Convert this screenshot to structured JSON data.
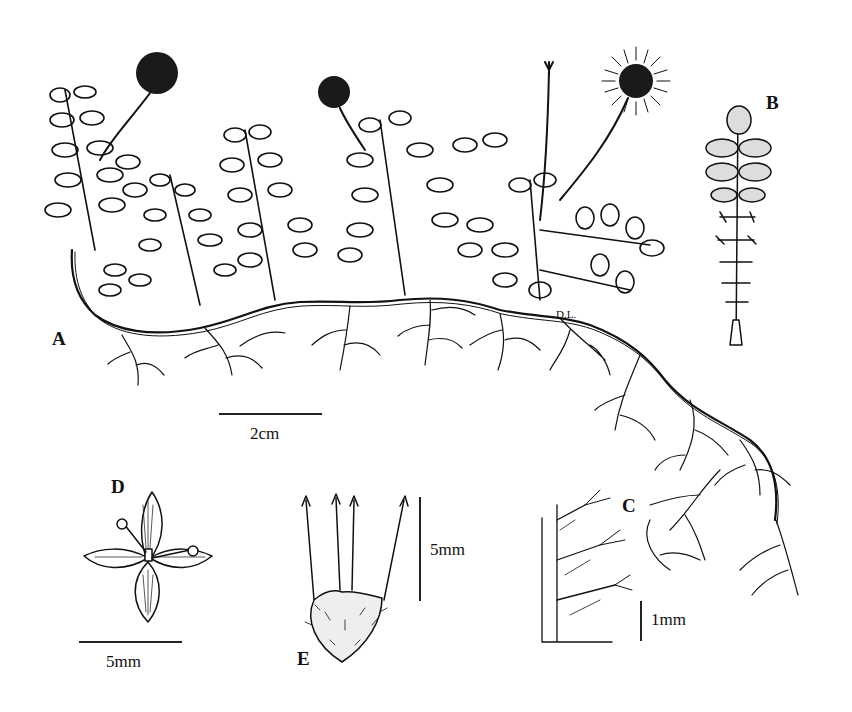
{
  "figure": {
    "type": "botanical-illustration",
    "panels": {
      "A": {
        "label": "A",
        "description": "Habit: creeping rhizomatous plant with pinnate leaves and globose flower heads"
      },
      "B": {
        "label": "B",
        "description": "Pinnate leaf"
      },
      "C": {
        "label": "C",
        "description": "Leaflet margin detail with hairs"
      },
      "D": {
        "label": "D",
        "description": "Flower, four petals, stamens"
      },
      "E": {
        "label": "E",
        "description": "Fruit / hypanthium with barbed spines"
      }
    },
    "scale_bars": {
      "A": {
        "text": "2cm"
      },
      "D": {
        "text": "5mm"
      },
      "E": {
        "text": "5mm"
      },
      "C": {
        "text": "1mm"
      }
    },
    "signature": "D.L."
  },
  "colors": {
    "ink": "#111111",
    "background": "#ffffff"
  }
}
